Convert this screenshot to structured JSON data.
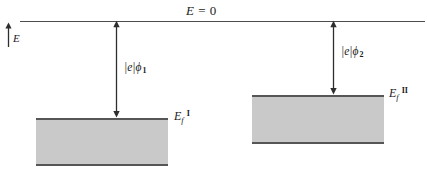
{
  "figure": {
    "kind": "energy-level-diagram",
    "background_color": "#ffffff",
    "band_fill_color": "#c9c9c9",
    "line_color": "#4d4d4d",
    "text_color": "#1a1a1a"
  },
  "vacuum_level": {
    "label_E": "E",
    "label_equals": " = ",
    "label_zero": "0",
    "line_y": 21,
    "line_x_start": 20,
    "line_x_end": 425
  },
  "energy_axis": {
    "label": "E",
    "direction": "up",
    "x": 8,
    "y_top": 24,
    "y_bottom": 46
  },
  "metals": [
    {
      "id": "metal-1",
      "roman": "I",
      "fermi_label_E": "E",
      "fermi_label_sub": "f",
      "fermi_label_sup": "I",
      "work_function": {
        "label_abs": "|e|",
        "label_phi": "ϕ",
        "label_sub": "1",
        "arrow_x": 116,
        "arrow_y_top": 21,
        "arrow_y_bottom": 118
      },
      "band": {
        "x": 36,
        "y": 118,
        "width": 132,
        "height": 48
      },
      "fermi_label_x": 174,
      "fermi_label_y": 110
    },
    {
      "id": "metal-2",
      "roman": "II",
      "fermi_label_E": "E",
      "fermi_label_sub": "f",
      "fermi_label_sup": "II",
      "work_function": {
        "label_abs": "|e|",
        "label_phi": "ϕ",
        "label_sub": "2",
        "arrow_x": 333,
        "arrow_y_top": 21,
        "arrow_y_bottom": 95
      },
      "band": {
        "x": 252,
        "y": 95,
        "width": 132,
        "height": 49
      },
      "fermi_label_x": 389,
      "fermi_label_y": 87
    }
  ]
}
